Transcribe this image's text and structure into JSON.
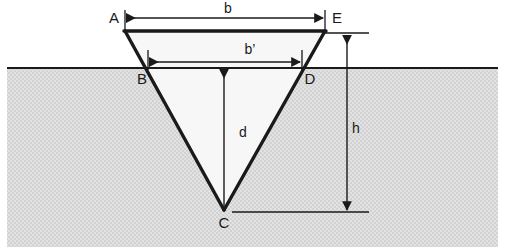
{
  "figure": {
    "background_color": "#ffffff",
    "ground_fill_color": "#dcdcdc",
    "ground_line_color": "#1a1a1a",
    "excavation_fill_color": "#f7f7f7",
    "outline_color": "#1a1a1a",
    "dimension_color": "#1a1a1a"
  },
  "vertices": [
    {
      "id": "A",
      "label": "A",
      "x": 125,
      "y": 31,
      "label_x": 114,
      "label_y": 19
    },
    {
      "id": "B",
      "label": "B",
      "x": 148,
      "y": 68,
      "label_x": 142,
      "label_y": 80
    },
    {
      "id": "C",
      "label": "C",
      "x": 224,
      "y": 209,
      "label_x": 224,
      "label_y": 224
    },
    {
      "id": "D",
      "label": "D",
      "x": 302,
      "y": 68,
      "label_x": 310,
      "label_y": 80
    },
    {
      "id": "E",
      "label": "E",
      "x": 325,
      "y": 31,
      "label_x": 337,
      "label_y": 19
    }
  ],
  "dimensions": [
    {
      "id": "b",
      "label": "b",
      "orientation": "horizontal",
      "from": "A",
      "to": "E",
      "x1": 127,
      "x2": 323,
      "y": 18,
      "label_x": 228,
      "label_y": 9
    },
    {
      "id": "b-prime",
      "label": "b’",
      "orientation": "horizontal",
      "from": "B",
      "to": "D",
      "x1": 150,
      "x2": 300,
      "y": 62,
      "label_x": 250,
      "label_y": 50
    },
    {
      "id": "d",
      "label": "d",
      "orientation": "vertical",
      "from": "ground-level",
      "to": "C",
      "x": 224,
      "y1": 70,
      "y2": 207,
      "label_x": 243,
      "label_y": 133
    },
    {
      "id": "h",
      "label": "h",
      "orientation": "vertical",
      "from": "E",
      "to": "C",
      "x": 347,
      "y1": 36,
      "y2": 210,
      "label_x": 356,
      "label_y": 129
    }
  ],
  "ground": {
    "line_y": 68,
    "left_x": 7,
    "right_x": 498,
    "bottom_y": 247
  },
  "extension_lines": [
    {
      "id": "ext-A",
      "x1": 125,
      "y1": 10,
      "x2": 125,
      "y2": 31
    },
    {
      "id": "ext-E-top",
      "x1": 325,
      "y1": 10,
      "x2": 325,
      "y2": 31
    },
    {
      "id": "ext-E-right",
      "x1": 325,
      "y1": 33,
      "x2": 369,
      "y2": 33
    },
    {
      "id": "ext-B",
      "x1": 148,
      "y1": 50,
      "x2": 148,
      "y2": 70
    },
    {
      "id": "ext-D",
      "x1": 302,
      "y1": 50,
      "x2": 302,
      "y2": 70
    },
    {
      "id": "ext-C-right",
      "x1": 232,
      "y1": 212,
      "x2": 369,
      "y2": 212
    }
  ]
}
